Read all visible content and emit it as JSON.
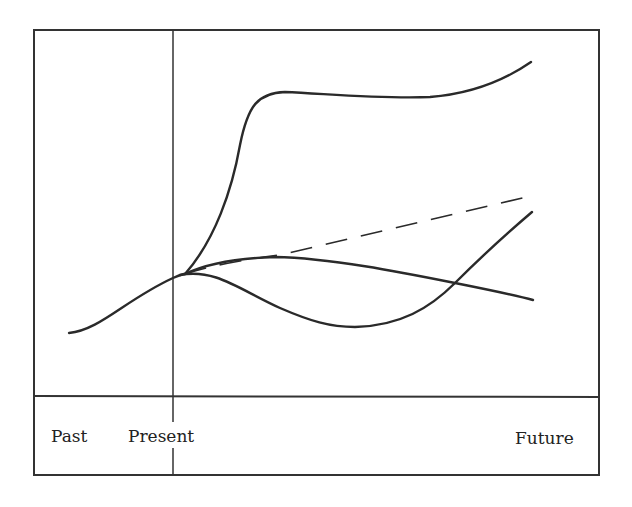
{
  "diagram": {
    "type": "futures-cone",
    "labels": {
      "past": "Past",
      "present": "Present",
      "future": "Future"
    },
    "colors": {
      "line": "#2a2a2a",
      "frame": "#333333",
      "background": "#ffffff"
    },
    "curves": [
      {
        "name": "past-trend",
        "style": "solid"
      },
      {
        "name": "surge-scenario",
        "style": "solid"
      },
      {
        "name": "extrapolated-trend",
        "style": "dashed"
      },
      {
        "name": "gradual-decline-scenario",
        "style": "solid"
      },
      {
        "name": "dip-and-recovery-scenario",
        "style": "solid"
      }
    ]
  }
}
